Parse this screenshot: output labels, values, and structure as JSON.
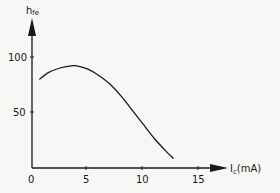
{
  "chart_data": {
    "type": "line",
    "title": "",
    "xlabel": "I_c(mA)",
    "ylabel": "h_fe",
    "xlim": [
      0,
      17
    ],
    "ylim": [
      0,
      115
    ],
    "x_ticks": [
      0,
      5,
      10,
      15
    ],
    "y_ticks": [
      50,
      100
    ],
    "grid": false,
    "legend": null,
    "series": [
      {
        "name": "h_fe vs I_c",
        "x": [
          0.7,
          1.5,
          2.5,
          3.5,
          4.0,
          5.0,
          6.0,
          7.0,
          8.0,
          9.0,
          10.0,
          11.0,
          12.0,
          12.6
        ],
        "values": [
          80,
          86,
          90,
          92,
          92,
          89,
          83,
          75,
          64,
          51,
          38,
          25,
          14,
          8
        ]
      }
    ]
  },
  "labels": {
    "x_axis": "I",
    "x_axis_sub": "c",
    "x_axis_unit": "(mA)",
    "y_axis": "h",
    "y_axis_sub": "fe",
    "x_tick_0": "0",
    "x_tick_5": "5",
    "x_tick_10": "10",
    "x_tick_15": "15",
    "y_tick_50": "50",
    "y_tick_100": "100"
  },
  "colors": {
    "line": "#1a1a1a",
    "background": "#f7f7f5"
  }
}
